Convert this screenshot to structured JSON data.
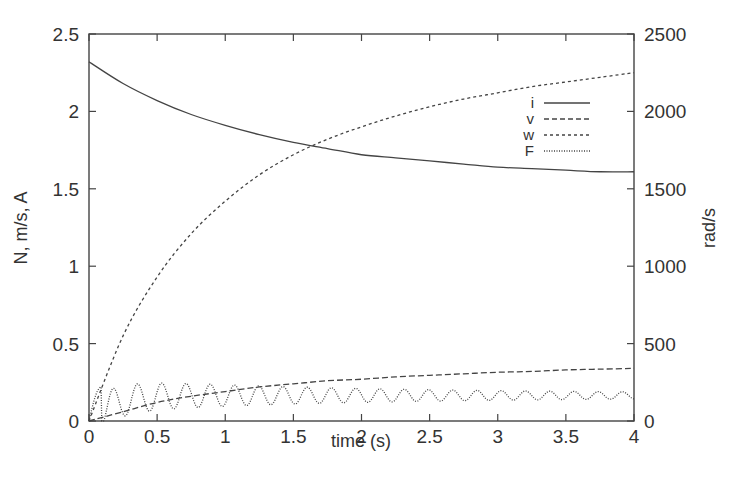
{
  "chart_data": {
    "type": "line",
    "title": "",
    "xlabel": "time (s)",
    "ylabel": "N, m/s, A",
    "y2label": "rad/s",
    "xlim": [
      0,
      4
    ],
    "ylim": [
      0,
      2.5
    ],
    "y2lim": [
      0,
      2500
    ],
    "x_ticks": [
      "0",
      "0.5",
      "1",
      "1.5",
      "2",
      "2.5",
      "3",
      "3.5",
      "4"
    ],
    "y_ticks": [
      "0",
      "0.5",
      "1",
      "1.5",
      "2",
      "2.5"
    ],
    "y2_ticks": [
      "0",
      "500",
      "1000",
      "1500",
      "2000",
      "2500"
    ],
    "grid": false,
    "legend_position": "upper right inside",
    "x": [
      0,
      0.25,
      0.5,
      0.75,
      1,
      1.25,
      1.5,
      1.75,
      2,
      2.25,
      2.5,
      2.75,
      3,
      3.25,
      3.5,
      3.75,
      4
    ],
    "series": [
      {
        "name": "i",
        "axis": "left",
        "style": "solid",
        "values": [
          2.32,
          2.18,
          2.07,
          1.98,
          1.91,
          1.85,
          1.8,
          1.76,
          1.72,
          1.7,
          1.68,
          1.66,
          1.64,
          1.63,
          1.62,
          1.61,
          1.61
        ]
      },
      {
        "name": "v",
        "axis": "left",
        "style": "long-dash",
        "values": [
          0,
          0.06,
          0.12,
          0.16,
          0.19,
          0.22,
          0.24,
          0.26,
          0.27,
          0.285,
          0.295,
          0.305,
          0.315,
          0.32,
          0.33,
          0.335,
          0.34
        ]
      },
      {
        "name": "w",
        "axis": "right",
        "style": "short-dash",
        "values": [
          0,
          550,
          930,
          1210,
          1420,
          1590,
          1720,
          1820,
          1900,
          1970,
          2030,
          2080,
          2120,
          2160,
          2190,
          2220,
          2250
        ]
      },
      {
        "name": "F",
        "axis": "left",
        "style": "dotted",
        "description": "oscillating ~0.02-0.22, period ~0.18 s, decaying amplitude around ~0.17",
        "values": [
          0,
          0.2,
          0.05,
          0.19,
          0.08,
          0.18,
          0.1,
          0.17,
          0.12,
          0.18,
          0.14,
          0.17,
          0.15,
          0.18,
          0.16,
          0.18,
          0.18
        ]
      }
    ]
  },
  "legend": {
    "items": [
      {
        "label": "i"
      },
      {
        "label": "v"
      },
      {
        "label": "w"
      },
      {
        "label": "F"
      }
    ]
  }
}
